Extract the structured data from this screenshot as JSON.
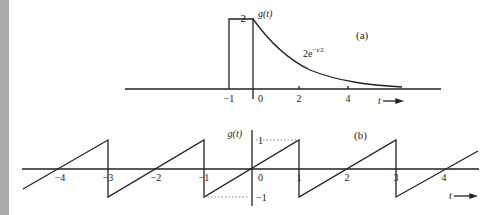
{
  "figure": {
    "panel_a": {
      "label": "(a)",
      "y_label": "g(t)",
      "peak_label": "2",
      "curve_label_base": "2e",
      "curve_label_exp": "−t/2",
      "x_ticks": [
        "−1",
        "0",
        "2",
        "4"
      ],
      "x_axis_label": "t"
    },
    "panel_b": {
      "label": "(b)",
      "y_label": "g(t)",
      "y_ticks": [
        "1",
        "−1"
      ],
      "x_ticks": [
        "−4",
        "−3",
        "−2",
        "−1",
        "0",
        "1",
        "2",
        "3",
        "4"
      ],
      "x_axis_label": "t"
    }
  },
  "colors": {
    "line": "#222222",
    "strip": "#a9a9a9",
    "dotted": "#888888"
  }
}
